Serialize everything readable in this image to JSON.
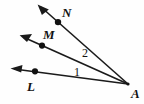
{
  "figure": {
    "type": "geometry-diagram",
    "canvas": {
      "width": 144,
      "height": 104,
      "background": "#fefefe"
    },
    "stroke_color": "#1a1a1a",
    "text_color": "#121212",
    "vertex": {
      "name": "A",
      "label": "A",
      "x": 128,
      "y": 84,
      "label_x": 131,
      "label_y": 98
    },
    "rays": [
      {
        "name": "ray-AL",
        "from_label": "A",
        "through_label": "L",
        "point_label": "L",
        "point_x": 35,
        "point_y": 71,
        "label_x": 27,
        "label_y": 91,
        "tip_x": 11,
        "tip_y": 69
      },
      {
        "name": "ray-AM",
        "from_label": "A",
        "through_label": "M",
        "point_label": "M",
        "point_x": 42,
        "point_y": 46,
        "label_x": 43,
        "label_y": 39,
        "tip_x": 20,
        "tip_y": 35
      },
      {
        "name": "ray-AN",
        "from_label": "A",
        "through_label": "N",
        "point_label": "N",
        "point_x": 58,
        "point_y": 22,
        "label_x": 62,
        "label_y": 17,
        "tip_x": 38,
        "tip_y": 5
      }
    ],
    "angles": [
      {
        "name": "angle-1",
        "label": "1",
        "between": "ray-AL and ray-AM",
        "label_x": 74,
        "label_y": 76
      },
      {
        "name": "angle-2",
        "label": "2",
        "between": "ray-AM and ray-AN",
        "label_x": 82,
        "label_y": 57
      }
    ]
  }
}
